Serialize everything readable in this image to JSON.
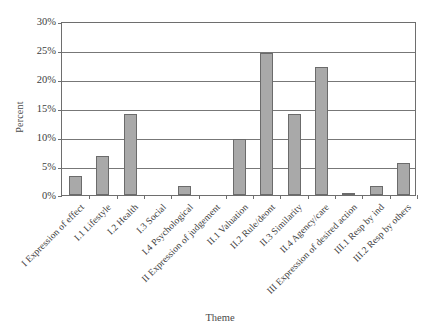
{
  "chart_data": {
    "type": "bar",
    "title": "",
    "xlabel": "Theme",
    "ylabel": "Percent",
    "ylim": [
      0,
      30
    ],
    "ytick_labels": [
      "0%",
      "5%",
      "10%",
      "15%",
      "20%",
      "25%",
      "30%"
    ],
    "ytick_values": [
      0,
      5,
      10,
      15,
      20,
      25,
      30
    ],
    "grid": true,
    "legend": false,
    "categories": [
      "I Expression of effect",
      "I.1 Lifestyle",
      "I.2 Health",
      "I.3 Social",
      "I.4 Psychological",
      "II Expression of judgement",
      "II.1 Valuation",
      "II.2 Rule/deont",
      "II.3 Similarity",
      "II.4 Agency/care",
      "III Expression of desired action",
      "III.1 Resp by ind",
      "III.2 Resp by others"
    ],
    "values": [
      3.2,
      6.8,
      14.0,
      0,
      1.5,
      0,
      9.7,
      24.4,
      13.9,
      22.0,
      0.4,
      1.6,
      5.6
    ],
    "bar_fill_color": "#a9a9a9",
    "bar_border_color": "#6b6b6b",
    "axis_color": "#6e6e6e",
    "grid_color": "#777777",
    "background_color": "#ffffff"
  }
}
